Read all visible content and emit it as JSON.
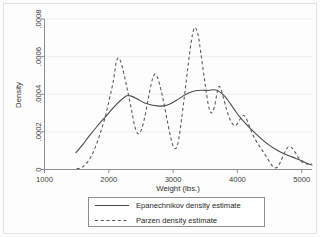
{
  "chart_data": {
    "type": "line",
    "title": "",
    "xlabel": "Weight (lbs.)",
    "ylabel": "Density",
    "xlim": [
      1000,
      5160
    ],
    "ylim": [
      0,
      0.0008
    ],
    "xticks": [
      1000,
      2000,
      3000,
      4000,
      5000
    ],
    "xticklabels": [
      "1000",
      "2000",
      "3000",
      "4000",
      "5000"
    ],
    "yticks": [
      0,
      0.0002,
      0.0004,
      0.0006,
      0.0008
    ],
    "yticklabels": [
      "0",
      ".0002",
      ".0004",
      ".0006",
      ".0008"
    ],
    "grid": "horizontal",
    "legend_position": "below-axes",
    "series": [
      {
        "name": "Epanechnikov density estimate",
        "style": "solid",
        "color": "#4a4a4a",
        "points": [
          [
            1490,
            9e-05
          ],
          [
            1600,
            0.000135
          ],
          [
            1700,
            0.00018
          ],
          [
            1800,
            0.000222
          ],
          [
            1900,
            0.000262
          ],
          [
            2000,
            0.0003
          ],
          [
            2100,
            0.00034
          ],
          [
            2200,
            0.000372
          ],
          [
            2280,
            0.000392
          ],
          [
            2350,
            0.00039
          ],
          [
            2450,
            0.000373
          ],
          [
            2550,
            0.000355
          ],
          [
            2650,
            0.000344
          ],
          [
            2750,
            0.000338
          ],
          [
            2850,
            0.000338
          ],
          [
            2950,
            0.000348
          ],
          [
            3050,
            0.000367
          ],
          [
            3150,
            0.00039
          ],
          [
            3250,
            0.000408
          ],
          [
            3350,
            0.000419
          ],
          [
            3450,
            0.000421
          ],
          [
            3550,
            0.00042
          ],
          [
            3620,
            0.000424
          ],
          [
            3700,
            0.000418
          ],
          [
            3800,
            0.00039
          ],
          [
            3900,
            0.000345
          ],
          [
            4000,
            0.000295
          ],
          [
            4100,
            0.000255
          ],
          [
            4200,
            0.000218
          ],
          [
            4300,
            0.000185
          ],
          [
            4400,
            0.000155
          ],
          [
            4500,
            0.000128
          ],
          [
            4600,
            0.000106
          ],
          [
            4700,
            8.8e-05
          ],
          [
            4800,
            7.3e-05
          ],
          [
            4900,
            6e-05
          ],
          [
            5000,
            4.6e-05
          ],
          [
            5100,
            3.1e-05
          ],
          [
            5160,
            2.4e-05
          ]
        ]
      },
      {
        "name": "Parzen density estimate",
        "style": "dashed",
        "color": "#565656",
        "points": [
          [
            1500,
            4e-06
          ],
          [
            1560,
            8e-06
          ],
          [
            1620,
            2e-05
          ],
          [
            1700,
            5.5e-05
          ],
          [
            1780,
            0.00011
          ],
          [
            1860,
            0.000185
          ],
          [
            1940,
            0.000275
          ],
          [
            2010,
            0.000375
          ],
          [
            2070,
            0.00047
          ],
          [
            2110,
            0.00056
          ],
          [
            2140,
            0.000592
          ],
          [
            2170,
            0.000585
          ],
          [
            2210,
            0.000545
          ],
          [
            2260,
            0.00047
          ],
          [
            2310,
            0.00039
          ],
          [
            2360,
            0.000305
          ],
          [
            2400,
            0.000235
          ],
          [
            2440,
            0.000195
          ],
          [
            2470,
            0.000192
          ],
          [
            2510,
            0.000215
          ],
          [
            2560,
            0.00028
          ],
          [
            2610,
            0.00037
          ],
          [
            2660,
            0.000455
          ],
          [
            2700,
            0.0005
          ],
          [
            2730,
            0.000505
          ],
          [
            2770,
            0.000478
          ],
          [
            2820,
            0.00041
          ],
          [
            2870,
            0.00033
          ],
          [
            2920,
            0.00024
          ],
          [
            2970,
            0.00016
          ],
          [
            3010,
            0.000118
          ],
          [
            3050,
            0.000115
          ],
          [
            3090,
            0.000165
          ],
          [
            3130,
            0.000265
          ],
          [
            3180,
            0.0004
          ],
          [
            3230,
            0.000545
          ],
          [
            3280,
            0.000675
          ],
          [
            3320,
            0.000745
          ],
          [
            3350,
            0.000752
          ],
          [
            3390,
            0.000715
          ],
          [
            3430,
            0.00062
          ],
          [
            3480,
            0.0005
          ],
          [
            3520,
            0.0004
          ],
          [
            3560,
            0.000325
          ],
          [
            3600,
            0.0003
          ],
          [
            3640,
            0.00033
          ],
          [
            3680,
            0.0004
          ],
          [
            3710,
            0.00044
          ],
          [
            3740,
            0.00043
          ],
          [
            3780,
            0.000385
          ],
          [
            3830,
            0.00032
          ],
          [
            3880,
            0.00027
          ],
          [
            3930,
            0.00024
          ],
          [
            3980,
            0.000235
          ],
          [
            4030,
            0.000262
          ],
          [
            4080,
            0.000285
          ],
          [
            4120,
            0.000282
          ],
          [
            4170,
            0.000245
          ],
          [
            4220,
            0.0002
          ],
          [
            4280,
            0.000158
          ],
          [
            4340,
            0.000125
          ],
          [
            4400,
            9.5e-05
          ],
          [
            4460,
            6.2e-05
          ],
          [
            4520,
            3e-05
          ],
          [
            4570,
            1.1e-05
          ],
          [
            4620,
            1.2e-05
          ],
          [
            4670,
            4e-05
          ],
          [
            4720,
            8e-05
          ],
          [
            4770,
            0.000112
          ],
          [
            4810,
            0.000122
          ],
          [
            4850,
            0.000115
          ],
          [
            4900,
            9e-05
          ],
          [
            4950,
            6.2e-05
          ],
          [
            5000,
            4.2e-05
          ],
          [
            5050,
            3.2e-05
          ],
          [
            5110,
            3e-05
          ],
          [
            5160,
            3.2e-05
          ]
        ]
      }
    ]
  },
  "legend": {
    "entries": [
      {
        "label": "Epanechnikov density estimate",
        "style": "solid"
      },
      {
        "label": "Parzen density estimate",
        "style": "dashed"
      }
    ]
  }
}
